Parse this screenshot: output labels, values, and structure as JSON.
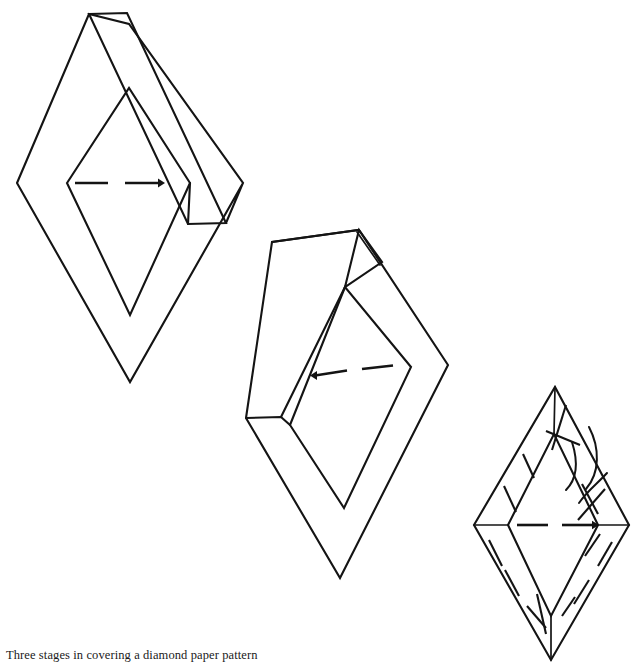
{
  "figure": {
    "caption": "Three stages in covering a diamond paper pattern",
    "title": "Three stages in covering a diamond paper pattern",
    "medium": "line drawing",
    "ink_color": "#141414",
    "background_color": "#ffffff",
    "canvas": {
      "width": 638,
      "height": 672
    },
    "stage_count": 3,
    "stages": [
      {
        "index": 1,
        "name": "stage-1-paper-pattern-with-fabric-strip",
        "label": "",
        "outer_diamond": {
          "top": [
            129,
            24
          ],
          "right": [
            243,
            183
          ],
          "bottom": [
            130,
            382
          ],
          "left": [
            17,
            183
          ]
        },
        "inner_diamond": {
          "top": [
            129,
            88
          ],
          "right": [
            190,
            183
          ],
          "bottom": [
            130,
            315
          ],
          "left": [
            67,
            183
          ]
        },
        "fold_strip": {
          "top_left": [
            89,
            14
          ],
          "top_right": [
            127,
            13
          ],
          "bottom_right": [
            226,
            223
          ],
          "bottom_left": [
            188,
            224
          ]
        },
        "center_marker": {
          "type": "dashed-arrow",
          "dash_1": [
            [
              75,
              183
            ],
            [
              108,
              183
            ]
          ],
          "dash_2": [
            [
              125,
              183
            ],
            [
              160,
              183
            ]
          ],
          "arrow_at": "right",
          "arrow_tip": [
            163,
            183
          ]
        }
      },
      {
        "index": 2,
        "name": "stage-2-paper-pattern-partly-folded",
        "label": "",
        "outer_diamond": {
          "top": [
            359,
            230
          ],
          "right": [
            448,
            365
          ],
          "bottom": [
            340,
            578
          ],
          "left": [
            246,
            418
          ]
        },
        "inner_diamond": {
          "top": [
            348,
            287
          ],
          "right": [
            411,
            367
          ],
          "bottom": [
            344,
            508
          ],
          "left": [
            290,
            425
          ]
        },
        "fold_strip": {
          "top_left": [
            272,
            242
          ],
          "top_right": [
            358,
            230
          ],
          "bottom_right": [
            281,
            417
          ],
          "bottom_left": [
            246,
            418
          ]
        },
        "corner_flap": {
          "apex": [
            359,
            230
          ],
          "fold_right": [
            381,
            262
          ],
          "fold_bottom": [
            345,
            287
          ]
        },
        "center_marker": {
          "type": "dashed-arrow",
          "dash_1": [
            [
              313,
              375
            ],
            [
              347,
              370
            ]
          ],
          "dash_2": [
            [
              362,
              369
            ],
            [
              392,
              366
            ]
          ],
          "arrow_at": "left",
          "arrow_tip": [
            310,
            376
          ]
        }
      },
      {
        "index": 3,
        "name": "stage-3-covered-diamond-with-stitching",
        "label": "",
        "outer_diamond": {
          "top": [
            555,
            387
          ],
          "right": [
            629,
            525
          ],
          "bottom": [
            551,
            660
          ],
          "left": [
            474,
            525
          ]
        },
        "inner_diamond": {
          "top": [
            554,
            434
          ],
          "right": [
            598,
            525
          ],
          "bottom": [
            551,
            616
          ],
          "left": [
            508,
            525
          ]
        },
        "center_marker": {
          "type": "dashed-arrow",
          "dash_1": [
            [
              517,
              525
            ],
            [
              549,
              525
            ]
          ],
          "dash_2": [
            [
              562,
              525
            ],
            [
              594,
              525
            ]
          ],
          "arrow_at": "right",
          "arrow_tip": [
            597,
            525
          ]
        },
        "stitch_dash_count": 12,
        "thread_curves": 2,
        "thread_note": "needle thread looping over the upper-right folded edge"
      }
    ]
  },
  "annotations": {
    "stitch_dashes_description": "short slanted basting stitches along the folded fabric edges of the third diamond",
    "thread_description": "curved thread lines crossing the upper right edge of the third diamond"
  }
}
